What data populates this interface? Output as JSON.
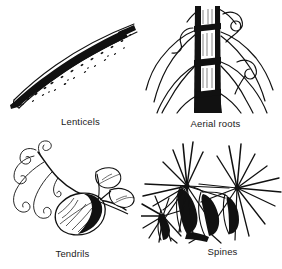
{
  "figure": {
    "background_color": "#ffffff",
    "ink_color": "#111111",
    "width": 282,
    "height": 269,
    "style": "black-and-white pen-and-ink botanical line drawings"
  },
  "panels": [
    {
      "id": "lenticels",
      "caption": "Lenticels",
      "icon": "lenticels-branch-illustration",
      "description": "A slender woody twig curving from lower left to upper right, its surface covered with small dark speckles (lenticels); the underside is shaded solid black.",
      "position": "top-left"
    },
    {
      "id": "aerial-roots",
      "caption": "Aerial roots",
      "icon": "aerial-roots-stem-illustration",
      "description": "An upright banded stem with several slender aerial roots arching outward and downward from the nodes, plus two small coiled tendril-like hooks.",
      "position": "top-right"
    },
    {
      "id": "tendrils",
      "caption": "Tendrils",
      "icon": "tendrils-vine-illustration",
      "description": "A vine stem bearing one large shaded ovate leaf and a smaller pair of leaflets, with several fine spiralling tendrils curling to the left.",
      "position": "bottom-left"
    },
    {
      "id": "spines",
      "caption": "Spines",
      "icon": "spines-cactus-illustration",
      "description": "A cactus pad with three radiating clusters (areoles) of long sharp spines and heavy black shading between the ribs.",
      "position": "bottom-right"
    }
  ]
}
